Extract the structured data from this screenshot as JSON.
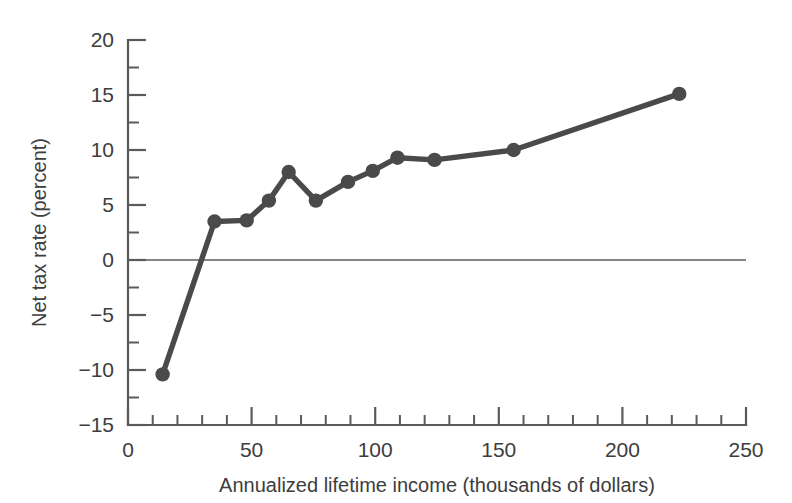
{
  "chart_data": {
    "type": "line",
    "title": "",
    "xlabel": "Annualized lifetime income (thousands of dollars)",
    "ylabel": "Net tax rate (percent)",
    "xlim": [
      0,
      250
    ],
    "ylim": [
      -15,
      20
    ],
    "x_ticks": [
      0,
      50,
      100,
      150,
      200,
      250
    ],
    "x_tick_labels": [
      "0",
      "50",
      "100",
      "150",
      "200",
      "250"
    ],
    "x_minor_step": 10,
    "y_ticks": [
      -15,
      -10,
      -5,
      0,
      5,
      10,
      15,
      20
    ],
    "y_tick_labels": [
      "−15",
      "−10",
      "−5",
      "0",
      "5",
      "10",
      "15",
      "20"
    ],
    "y_minor_step": 2.5,
    "grid": false,
    "legend": "none",
    "zero_line": true,
    "series": [
      {
        "name": "Net tax rate",
        "color": "#4a4a4a",
        "marker": "circle",
        "x": [
          14,
          35,
          48,
          57,
          65,
          76,
          89,
          99,
          109,
          124,
          156,
          223
        ],
        "values": [
          -10.4,
          3.5,
          3.6,
          5.4,
          8.0,
          5.4,
          7.1,
          8.1,
          9.3,
          9.1,
          10.0,
          15.1
        ]
      }
    ]
  },
  "colors": {
    "series": "#4a4a4a",
    "axis": "#5a5a5a",
    "text": "#3d3d3d",
    "background": "#ffffff"
  }
}
